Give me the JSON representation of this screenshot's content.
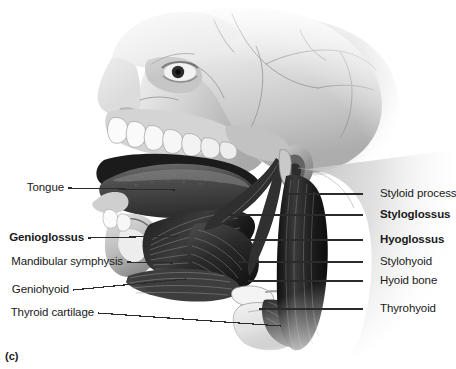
{
  "figure": {
    "caption": "(c)",
    "title": "Lateral view of extrinsic tongue and suprahyoid muscles",
    "view": "sagittal-lateral-skull"
  },
  "labels_left": [
    {
      "text": "Tongue",
      "bold": false,
      "x": 5,
      "y": 188,
      "leader": {
        "x1": 68,
        "y1": 188,
        "x2": 175,
        "y2": 190
      }
    },
    {
      "text": "Genioglossus",
      "bold": true,
      "x": 5,
      "y": 238,
      "leader": {
        "x1": 88,
        "y1": 238,
        "x2": 178,
        "y2": 236
      }
    },
    {
      "text": "Mandibular symphysis",
      "bold": false,
      "x": 5,
      "y": 262,
      "leader": {
        "x1": 127,
        "y1": 262,
        "x2": 173,
        "y2": 263
      }
    },
    {
      "text": "Geniohyoid",
      "bold": false,
      "x": 5,
      "y": 290,
      "leader": {
        "x1": 73,
        "y1": 290,
        "x2": 186,
        "y2": 279
      }
    },
    {
      "text": "Thyroid cartilage",
      "bold": false,
      "x": 5,
      "y": 313,
      "leader": {
        "x1": 98,
        "y1": 313,
        "x2": 281,
        "y2": 326
      }
    }
  ],
  "labels_right": [
    {
      "text": "Styloid process",
      "bold": false,
      "x": 380,
      "y": 194,
      "leader": {
        "x1": 363,
        "y1": 194,
        "x2": 286,
        "y2": 194
      }
    },
    {
      "text": "Styloglossus",
      "bold": true,
      "x": 380,
      "y": 215,
      "leader": {
        "x1": 363,
        "y1": 215,
        "x2": 228,
        "y2": 215
      }
    },
    {
      "text": "Hyoglossus",
      "bold": true,
      "x": 380,
      "y": 240,
      "leader": {
        "x1": 363,
        "y1": 240,
        "x2": 228,
        "y2": 240
      }
    },
    {
      "text": "Stylohyoid",
      "bold": false,
      "x": 380,
      "y": 262,
      "leader": {
        "x1": 363,
        "y1": 262,
        "x2": 238,
        "y2": 262
      }
    },
    {
      "text": "Hyoid bone",
      "bold": false,
      "x": 380,
      "y": 281,
      "leader": {
        "x1": 363,
        "y1": 281,
        "x2": 248,
        "y2": 281
      }
    },
    {
      "text": "Thyrohyoid",
      "bold": false,
      "x": 380,
      "y": 309,
      "leader": {
        "x1": 363,
        "y1": 309,
        "x2": 259,
        "y2": 309
      }
    }
  ],
  "colors": {
    "background": "#ffffff",
    "label_text": "#1a1a1a",
    "leader_line": "#2b2b2b",
    "bone_light": "#d8d8d8",
    "bone_mid": "#b4b4b4",
    "bone_shadow": "#8f8f8f",
    "skin_light": "#e3e3e3",
    "tooth": "#fbfbfb",
    "muscle_dark": "#262626",
    "muscle_mid": "#4a4a4a",
    "cartilage": "#efefef"
  }
}
